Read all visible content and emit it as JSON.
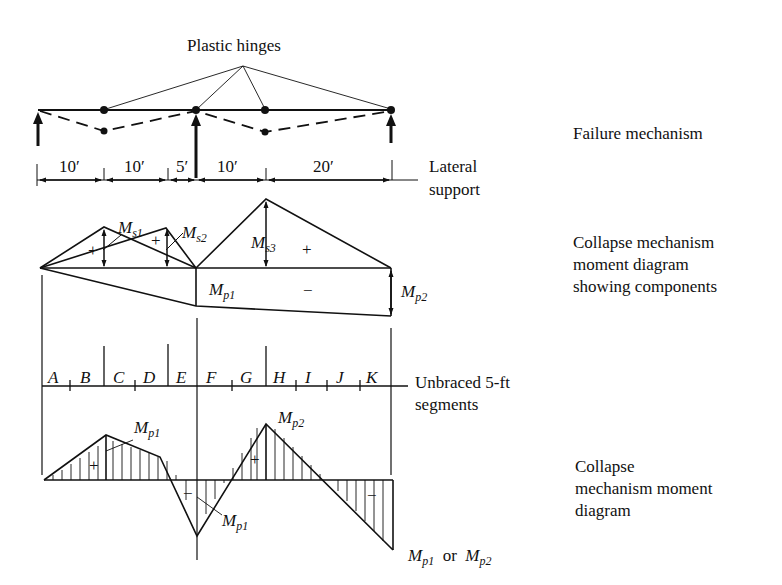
{
  "diagram": {
    "labels": {
      "plastic_hinges": "Plastic hinges",
      "failure_mechanism": "Failure mechanism",
      "lateral_support_1": "Lateral",
      "lateral_support_2": "support",
      "collapse_components_1": "Collapse mechanism",
      "collapse_components_2": "moment diagram",
      "collapse_components_3": "showing components",
      "unbraced_1": "Unbraced 5-ft",
      "unbraced_2": "segments",
      "collapse_diagram_1": "Collapse",
      "collapse_diagram_2": "mechanism moment",
      "collapse_diagram_3": "diagram"
    },
    "dimensions": [
      "10′",
      "10′",
      "5′",
      "10′",
      "20′"
    ],
    "moments": {
      "ms": "M",
      "s1": "s1",
      "s2": "s2",
      "s3": "s3",
      "mp": "M",
      "p1": "p1",
      "p2": "p2",
      "or": "or",
      "plus": "+",
      "minus": "−"
    },
    "segments": [
      "A",
      "B",
      "C",
      "D",
      "E",
      "F",
      "G",
      "H",
      "I",
      "J",
      "K"
    ]
  }
}
